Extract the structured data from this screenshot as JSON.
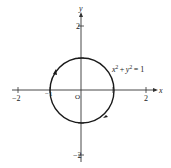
{
  "figure": {
    "type": "graph",
    "equation": {
      "x": "x",
      "plus": "+",
      "y": "y",
      "exp": "2",
      "equals": "= 1"
    },
    "axes": {
      "x_label": "x",
      "y_label": "y",
      "origin_label": "O",
      "x_ticks": [
        "−2",
        "−1",
        "2"
      ],
      "y_ticks": [
        "2",
        "1",
        "−1",
        "−2"
      ]
    },
    "curve": {
      "name": "unit circle",
      "center": [
        0,
        0
      ],
      "radius": 1
    },
    "colors": {
      "stroke": "#222222",
      "background": "#ffffff"
    }
  }
}
